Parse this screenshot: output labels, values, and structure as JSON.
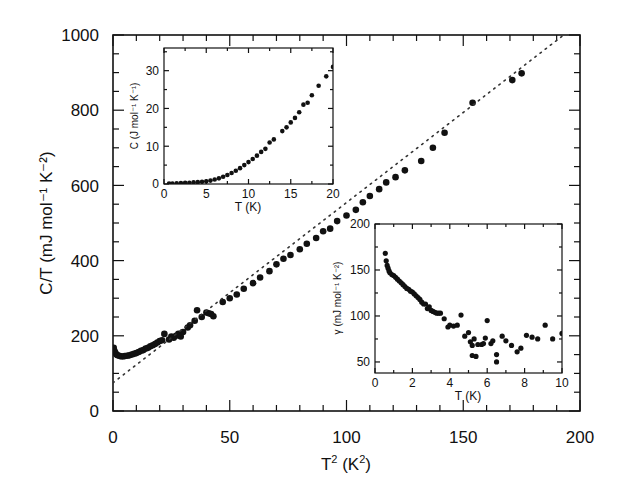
{
  "chart_data": [
    {
      "id": "main",
      "type": "scatter",
      "title": "",
      "xlabel": "T² (K²)",
      "xlabel_base": "T",
      "xlabel_sup": "2",
      "xlabel_rest": " (K",
      "xlabel_sup2": "2",
      "xlabel_end": ")",
      "ylabel": "C/T (mJ mol⁻¹ K⁻²)",
      "xlim": [
        0,
        200
      ],
      "ylim": [
        0,
        1000
      ],
      "xticks": [
        0,
        50,
        100,
        150,
        200
      ],
      "xtick_labels": [
        "0",
        "50",
        "100",
        "150",
        "200"
      ],
      "yticks": [
        0,
        200,
        400,
        600,
        800,
        1000
      ],
      "ytick_labels": [
        "0",
        "200",
        "400",
        "600",
        "800",
        "1000"
      ],
      "grid": false,
      "legend": null,
      "series": [
        {
          "name": "data",
          "marker": "filled-circle",
          "points": [
            [
              0.3,
              168
            ],
            [
              0.6,
              160
            ],
            [
              1,
              155
            ],
            [
              1.5,
              150
            ],
            [
              2,
              148
            ],
            [
              3,
              146
            ],
            [
              4,
              145
            ],
            [
              5,
              146
            ],
            [
              6,
              147
            ],
            [
              7,
              148
            ],
            [
              8,
              150
            ],
            [
              9,
              152
            ],
            [
              10,
              154
            ],
            [
              11,
              157
            ],
            [
              12,
              160
            ],
            [
              13,
              162
            ],
            [
              14,
              166
            ],
            [
              15,
              168
            ],
            [
              16,
              172
            ],
            [
              17,
              175
            ],
            [
              18,
              178
            ],
            [
              19,
              182
            ],
            [
              20,
              186
            ],
            [
              21,
              188
            ],
            [
              22,
              205
            ],
            [
              24,
              190
            ],
            [
              25,
              198
            ],
            [
              26,
              195
            ],
            [
              27,
              200
            ],
            [
              28,
              205
            ],
            [
              29,
              198
            ],
            [
              30,
              210
            ],
            [
              32,
              222
            ],
            [
              33,
              228
            ],
            [
              35,
              240
            ],
            [
              36,
              268
            ],
            [
              38,
              250
            ],
            [
              40,
              262
            ],
            [
              41,
              260
            ],
            [
              42,
              258
            ],
            [
              43,
              252
            ],
            [
              47,
              290
            ],
            [
              50,
              300
            ],
            [
              53,
              310
            ],
            [
              56,
              325
            ],
            [
              60,
              340
            ],
            [
              63,
              355
            ],
            [
              67,
              372
            ],
            [
              70,
              390
            ],
            [
              73,
              405
            ],
            [
              76,
              415
            ],
            [
              80,
              430
            ],
            [
              83,
              445
            ],
            [
              87,
              460
            ],
            [
              90,
              478
            ],
            [
              93,
              485
            ],
            [
              96,
              505
            ],
            [
              100,
              520
            ],
            [
              104,
              535
            ],
            [
              107,
              555
            ],
            [
              110,
              572
            ],
            [
              114,
              590
            ],
            [
              117,
              608
            ],
            [
              121,
              622
            ],
            [
              125,
              640
            ],
            [
              132,
              665
            ],
            [
              137,
              700
            ],
            [
              142,
              740
            ],
            [
              154,
              820
            ],
            [
              171,
              880
            ],
            [
              175,
              898
            ]
          ]
        },
        {
          "name": "linear fit",
          "style": "dotted",
          "line": [
            [
              0,
              75
            ],
            [
              193,
              1000
            ]
          ]
        }
      ]
    },
    {
      "id": "inset-top-left",
      "type": "scatter",
      "xlabel": "T (K)",
      "ylabel": "C (J mol⁻¹ K⁻¹)",
      "xlim": [
        0,
        20
      ],
      "ylim": [
        0,
        36
      ],
      "xticks": [
        0,
        5,
        10,
        15,
        20
      ],
      "xtick_labels": [
        "0",
        "5",
        "10",
        "15",
        "20"
      ],
      "yticks": [
        0,
        10,
        20,
        30
      ],
      "ytick_labels": [
        "0",
        "10",
        "20",
        "30"
      ],
      "series": [
        {
          "name": "C",
          "marker": "filled-circle",
          "points": [
            [
              0.6,
              0.1
            ],
            [
              1,
              0.15
            ],
            [
              1.5,
              0.2
            ],
            [
              2,
              0.25
            ],
            [
              2.5,
              0.3
            ],
            [
              3,
              0.35
            ],
            [
              3.5,
              0.45
            ],
            [
              4,
              0.5
            ],
            [
              4.5,
              0.6
            ],
            [
              5,
              0.7
            ],
            [
              5.5,
              0.9
            ],
            [
              6,
              1.2
            ],
            [
              6.5,
              1.5
            ],
            [
              7,
              1.9
            ],
            [
              7.5,
              2.4
            ],
            [
              8,
              2.9
            ],
            [
              8.5,
              3.5
            ],
            [
              9,
              4.2
            ],
            [
              9.5,
              5
            ],
            [
              10,
              5.8
            ],
            [
              10.5,
              6.6
            ],
            [
              11,
              7.5
            ],
            [
              11.5,
              8.5
            ],
            [
              12,
              9.3
            ],
            [
              12.5,
              11
            ],
            [
              13,
              11.8
            ],
            [
              14,
              14
            ],
            [
              14.5,
              15
            ],
            [
              15,
              16.3
            ],
            [
              15.5,
              17.5
            ],
            [
              16,
              19
            ],
            [
              16.5,
              21
            ],
            [
              17,
              21.5
            ],
            [
              17.5,
              23.5
            ],
            [
              18.3,
              26
            ],
            [
              19.2,
              28.5
            ],
            [
              20,
              31
            ]
          ]
        }
      ]
    },
    {
      "id": "inset-bottom-right",
      "type": "scatter",
      "xlabel": "T (K)",
      "ylabel": "γ (mJ mol⁻¹ K⁻²)",
      "xlim": [
        0,
        10
      ],
      "ylim": [
        38,
        200
      ],
      "xticks": [
        0,
        2,
        4,
        6,
        8,
        10
      ],
      "xtick_labels": [
        "0",
        "2",
        "4",
        "6",
        "8",
        "10"
      ],
      "yticks": [
        50,
        100,
        150,
        200
      ],
      "ytick_labels": [
        "50",
        "100",
        "150",
        "200"
      ],
      "series": [
        {
          "name": "gamma",
          "marker": "filled-circle",
          "points": [
            [
              0.55,
              168
            ],
            [
              0.6,
              160
            ],
            [
              0.65,
              155
            ],
            [
              0.7,
              152
            ],
            [
              0.75,
              149
            ],
            [
              0.8,
              147
            ],
            [
              0.9,
              145
            ],
            [
              1,
              144
            ],
            [
              1.1,
              142
            ],
            [
              1.2,
              140
            ],
            [
              1.3,
              138
            ],
            [
              1.4,
              136
            ],
            [
              1.5,
              134
            ],
            [
              1.6,
              132
            ],
            [
              1.7,
              130
            ],
            [
              1.8,
              129
            ],
            [
              1.9,
              127
            ],
            [
              2,
              126
            ],
            [
              2.1,
              124
            ],
            [
              2.2,
              122
            ],
            [
              2.3,
              120
            ],
            [
              2.4,
              118
            ],
            [
              2.5,
              115
            ],
            [
              2.6,
              113
            ],
            [
              2.7,
              113
            ],
            [
              2.8,
              108
            ],
            [
              2.9,
              110
            ],
            [
              3,
              106
            ],
            [
              3.1,
              105
            ],
            [
              3.2,
              104
            ],
            [
              3.3,
              103
            ],
            [
              3.4,
              103
            ],
            [
              3.5,
              103
            ],
            [
              3.7,
              97
            ],
            [
              3.9,
              88
            ],
            [
              4,
              90
            ],
            [
              4.2,
              89
            ],
            [
              4.4,
              90
            ],
            [
              4.6,
              101
            ],
            [
              4.8,
              78
            ],
            [
              5,
              82
            ],
            [
              5.1,
              72
            ],
            [
              5.2,
              68
            ],
            [
              5.2,
              57
            ],
            [
              5.3,
              75
            ],
            [
              5.4,
              56
            ],
            [
              5.5,
              69
            ],
            [
              5.7,
              69
            ],
            [
              5.8,
              70
            ],
            [
              5.9,
              76
            ],
            [
              6,
              95
            ],
            [
              6.2,
              70
            ],
            [
              6.3,
              73
            ],
            [
              6.5,
              58
            ],
            [
              6.5,
              50
            ],
            [
              6.8,
              78
            ],
            [
              7,
              73
            ],
            [
              7.3,
              68
            ],
            [
              7.6,
              61
            ],
            [
              7.8,
              65
            ],
            [
              8.1,
              79
            ],
            [
              8.4,
              77
            ],
            [
              8.7,
              75
            ],
            [
              9.1,
              90
            ],
            [
              9.5,
              75
            ],
            [
              10,
              81
            ]
          ]
        }
      ]
    }
  ]
}
